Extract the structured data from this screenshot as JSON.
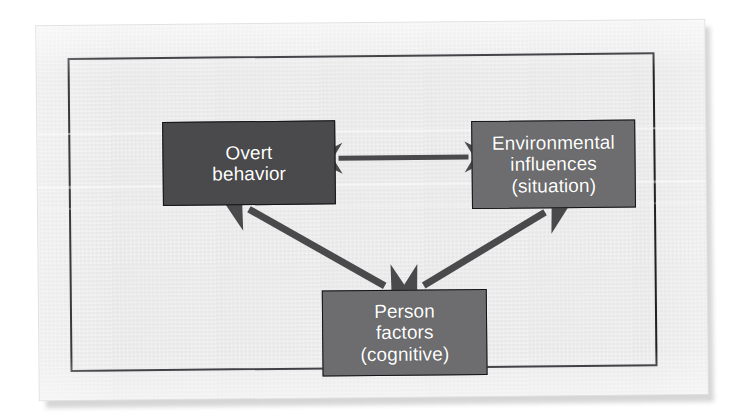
{
  "figure": {
    "kind": "reciprocal-determinism-triadic-diagram",
    "background_color": "#ebebeb",
    "frame_color": "#15161a",
    "boxes": [
      {
        "id": "overt-behavior",
        "lines": [
          "Overt",
          "behavior"
        ],
        "fill_color": "#4a4a4c",
        "text_color": "#ffffff"
      },
      {
        "id": "environmental-influences",
        "lines": [
          "Environmental",
          "influences",
          "(situation)"
        ],
        "fill_color": "#6d6d6f",
        "text_color": "#ffffff"
      },
      {
        "id": "person-factors",
        "lines": [
          "Person",
          "factors",
          "(cognitive)"
        ],
        "fill_color": "#6d6d6f",
        "text_color": "#ffffff"
      }
    ],
    "arrows": [
      {
        "id": "overt-to-environment",
        "from": "overt-behavior",
        "to": "environmental-influences",
        "style": "double-headed",
        "orientation": "horizontal",
        "color": "#4a4a4c"
      },
      {
        "id": "overt-to-person",
        "from": "overt-behavior",
        "to": "person-factors",
        "style": "double-headed",
        "orientation": "diagonal",
        "color": "#4a4a4c"
      },
      {
        "id": "environment-to-person",
        "from": "environmental-influences",
        "to": "person-factors",
        "style": "double-headed",
        "orientation": "diagonal",
        "color": "#4a4a4c"
      }
    ]
  }
}
